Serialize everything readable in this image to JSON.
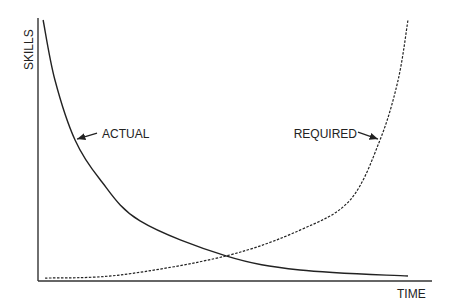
{
  "chart_data": {
    "type": "line",
    "title": "",
    "xlabel": "TIME",
    "ylabel": "SKILLS",
    "xlim": [
      0,
      100
    ],
    "ylim": [
      0,
      100
    ],
    "grid": false,
    "legend": "none",
    "series": [
      {
        "name": "ACTUAL",
        "style": "solid",
        "color": "#222222",
        "x": [
          1.3,
          4.3,
          9.4,
          15.7,
          25.9,
          47.7,
          66.5,
          93.9
        ],
        "y": [
          100,
          77,
          54,
          39,
          23,
          9.6,
          4.2,
          1.9
        ]
      },
      {
        "name": "REQUIRED",
        "style": "dashed",
        "color": "#222222",
        "x": [
          1.8,
          20.8,
          47.7,
          66.5,
          79.2,
          86.8,
          91.4,
          93.9
        ],
        "y": [
          1.1,
          2.3,
          9.6,
          19.5,
          31,
          54,
          77,
          100
        ]
      }
    ],
    "annotations": [
      {
        "text": "ACTUAL",
        "series": "ACTUAL",
        "arrow_to": [
          9.4,
          54
        ]
      },
      {
        "text": "REQUIRED",
        "series": "REQUIRED",
        "arrow_to": [
          86.8,
          54
        ]
      }
    ]
  }
}
